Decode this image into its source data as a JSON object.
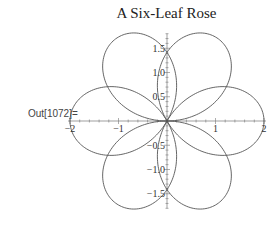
{
  "cell": {
    "out_label": "Out[1072]="
  },
  "chart_data": {
    "type": "line",
    "subtype": "polar-rose",
    "title": "A Six-Leaf Rose",
    "xlabel": "",
    "ylabel": "",
    "xlim": [
      -2,
      2
    ],
    "ylim": [
      -1.8,
      1.8
    ],
    "grid": false,
    "legend": null,
    "petals": 6,
    "petal_axes_deg": [
      0,
      60,
      120,
      180,
      240,
      300
    ],
    "petal_length": 2,
    "axis_crossings_y": [
      1.5,
      -1.5
    ],
    "x_ticks": [
      {
        "value": -2,
        "label": "-2"
      },
      {
        "value": -1,
        "label": "-1"
      },
      {
        "value": 1,
        "label": "1"
      },
      {
        "value": 2,
        "label": "2"
      }
    ],
    "y_ticks": [
      {
        "value": 1.5,
        "label": "1.5"
      },
      {
        "value": 1.0,
        "label": "1.0"
      },
      {
        "value": 0.5,
        "label": "0.5"
      },
      {
        "value": -0.5,
        "label": "-0.5"
      },
      {
        "value": -1.0,
        "label": "-1.0"
      },
      {
        "value": -1.5,
        "label": "-1.5"
      }
    ],
    "line_color": "#555555"
  }
}
